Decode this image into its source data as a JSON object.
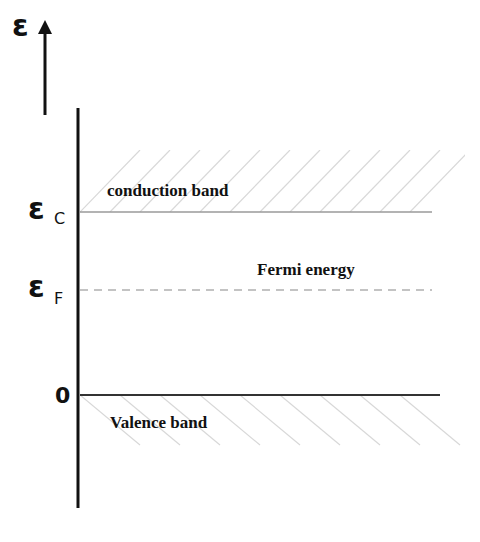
{
  "diagram": {
    "type": "energy-band-diagram",
    "axis": {
      "symbol": "ε",
      "direction": "up"
    },
    "levels": [
      {
        "id": "conduction",
        "symbol": "ε",
        "subscript": "C",
        "label": "conduction band",
        "style": "solid-gray",
        "hatch": "above"
      },
      {
        "id": "fermi",
        "symbol": "ε",
        "subscript": "F",
        "label": "Fermi energy",
        "style": "dashed-gray"
      },
      {
        "id": "zero",
        "symbol": "0",
        "subscript": "",
        "label": "Valence band",
        "style": "solid-dark",
        "hatch": "below"
      }
    ]
  },
  "colors": {
    "axis": "#111111",
    "conduction_line": "#9a9a9a",
    "fermi_line": "#b0b0b0",
    "valence_line": "#333333",
    "hatch": "#d8d8d8"
  }
}
